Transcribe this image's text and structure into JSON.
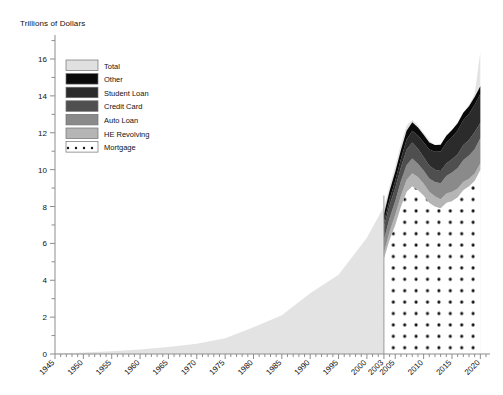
{
  "chart_data": {
    "type": "area",
    "title": "",
    "ylabel": "Trillions of Dollars",
    "xlabel": "",
    "ylim": [
      0,
      17
    ],
    "xlim": [
      1945,
      2021
    ],
    "grid": false,
    "legend_position": "upper-left-inside",
    "y_ticks": [
      0,
      2,
      4,
      6,
      8,
      10,
      12,
      14,
      16
    ],
    "y_tick_labels": [
      "0",
      "2",
      "4",
      "6",
      "8",
      "10",
      "12",
      "14",
      "16"
    ],
    "y_minor_ticks": [
      1,
      3,
      5,
      7,
      9,
      11,
      13,
      15
    ],
    "x_ticks": [
      1945,
      1950,
      1955,
      1960,
      1965,
      1970,
      1975,
      1980,
      1985,
      1990,
      1995,
      2000,
      2003,
      2005,
      2010,
      2015,
      2020
    ],
    "x_tick_labels": [
      "1945",
      "1950",
      "1955",
      "1960",
      "1965",
      "1970",
      "1975",
      "1980",
      "1985",
      "1990",
      "1995",
      "2000",
      "2003",
      "2005",
      "2010",
      "2015",
      "2020"
    ],
    "legend": [
      {
        "label": "Total",
        "color": "#e0e0e0"
      },
      {
        "label": "Other",
        "color": "#0a0a0a"
      },
      {
        "label": "Student Loan",
        "color": "#2b2b2b"
      },
      {
        "label": "Credit Card",
        "color": "#4f4f4f"
      },
      {
        "label": "Auto Loan",
        "color": "#8a8a8a"
      },
      {
        "label": "HE Revolving",
        "color": "#b5b5b5"
      },
      {
        "label": "Mortgage",
        "color": "#ffffff",
        "pattern": "dots"
      }
    ],
    "series": [
      {
        "name": "Total",
        "note": "Aggregate household debt, 1945-2003 (single light-gray area)",
        "x": [
          1945,
          1950,
          1955,
          1960,
          1965,
          1970,
          1975,
          1980,
          1985,
          1990,
          1995,
          2000,
          2003
        ],
        "values": [
          0.03,
          0.08,
          0.15,
          0.24,
          0.38,
          0.55,
          0.85,
          1.45,
          2.1,
          3.3,
          4.3,
          6.3,
          8.0
        ]
      },
      {
        "name": "Total",
        "note": "Total outer envelope, 2003-2020",
        "x": [
          2003,
          2004,
          2005,
          2006,
          2007,
          2008,
          2009,
          2010,
          2011,
          2012,
          2013,
          2014,
          2015,
          2016,
          2017,
          2018,
          2019,
          2020
        ],
        "values": [
          8.0,
          9.1,
          10.2,
          11.4,
          12.4,
          12.7,
          12.4,
          12.0,
          11.6,
          11.3,
          11.3,
          11.7,
          12.1,
          12.6,
          13.1,
          13.5,
          14.1,
          16.4
        ]
      },
      {
        "name": "Mortgage",
        "x": [
          2003,
          2004,
          2005,
          2006,
          2007,
          2008,
          2009,
          2010,
          2011,
          2012,
          2013,
          2014,
          2015,
          2016,
          2017,
          2018,
          2019,
          2020
        ],
        "values": [
          5.2,
          6.2,
          7.0,
          8.0,
          8.8,
          9.1,
          8.9,
          8.6,
          8.2,
          8.0,
          7.9,
          8.2,
          8.3,
          8.5,
          8.9,
          9.1,
          9.4,
          10.0
        ]
      },
      {
        "name": "HE Revolving",
        "x": [
          2003,
          2004,
          2005,
          2006,
          2007,
          2008,
          2009,
          2010,
          2011,
          2012,
          2013,
          2014,
          2015,
          2016,
          2017,
          2018,
          2019,
          2020
        ],
        "values": [
          0.3,
          0.45,
          0.55,
          0.6,
          0.65,
          0.7,
          0.7,
          0.65,
          0.6,
          0.55,
          0.5,
          0.5,
          0.5,
          0.47,
          0.44,
          0.41,
          0.39,
          0.35
        ]
      },
      {
        "name": "Auto Loan",
        "x": [
          2003,
          2004,
          2005,
          2006,
          2007,
          2008,
          2009,
          2010,
          2011,
          2012,
          2013,
          2014,
          2015,
          2016,
          2017,
          2018,
          2019,
          2020
        ],
        "values": [
          0.7,
          0.72,
          0.75,
          0.78,
          0.8,
          0.8,
          0.72,
          0.7,
          0.72,
          0.78,
          0.86,
          0.95,
          1.05,
          1.12,
          1.18,
          1.25,
          1.32,
          1.37
        ]
      },
      {
        "name": "Credit Card",
        "x": [
          2003,
          2004,
          2005,
          2006,
          2007,
          2008,
          2009,
          2010,
          2011,
          2012,
          2013,
          2014,
          2015,
          2016,
          2017,
          2018,
          2019,
          2020
        ],
        "values": [
          0.69,
          0.7,
          0.72,
          0.75,
          0.83,
          0.87,
          0.81,
          0.73,
          0.7,
          0.67,
          0.66,
          0.68,
          0.71,
          0.75,
          0.81,
          0.85,
          0.93,
          0.82
        ]
      },
      {
        "name": "Student Loan",
        "x": [
          2003,
          2004,
          2005,
          2006,
          2007,
          2008,
          2009,
          2010,
          2011,
          2012,
          2013,
          2014,
          2015,
          2016,
          2017,
          2018,
          2019,
          2020
        ],
        "values": [
          0.24,
          0.31,
          0.39,
          0.45,
          0.55,
          0.64,
          0.72,
          0.81,
          0.87,
          0.97,
          1.06,
          1.13,
          1.2,
          1.28,
          1.36,
          1.42,
          1.48,
          1.56
        ]
      },
      {
        "name": "Other",
        "x": [
          2003,
          2004,
          2005,
          2006,
          2007,
          2008,
          2009,
          2010,
          2011,
          2012,
          2013,
          2014,
          2015,
          2016,
          2017,
          2018,
          2019,
          2020
        ],
        "values": [
          0.45,
          0.46,
          0.47,
          0.48,
          0.48,
          0.46,
          0.43,
          0.4,
          0.38,
          0.37,
          0.37,
          0.38,
          0.39,
          0.4,
          0.4,
          0.41,
          0.42,
          0.42
        ]
      }
    ]
  }
}
